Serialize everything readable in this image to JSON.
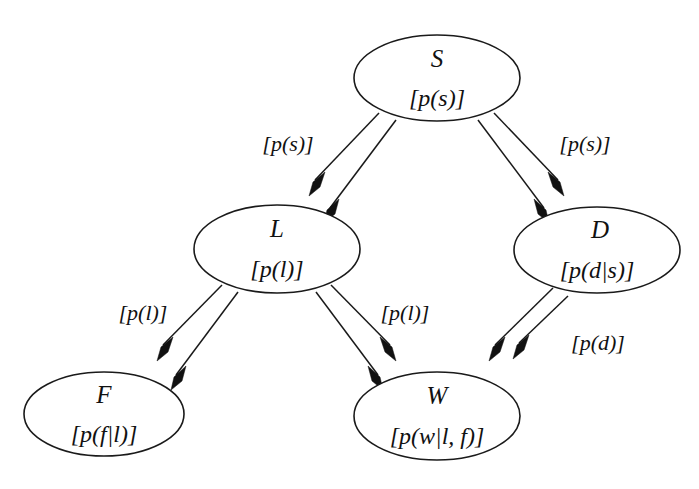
{
  "diagram": {
    "type": "bayesian-network-dag",
    "title": "",
    "background_color": "#ffffff",
    "stroke_color": "#1a1a1a",
    "nodes": [
      {
        "id": "S",
        "name": "S",
        "prob": "[p(s)]",
        "cx": 437,
        "cy": 78,
        "rx": 83,
        "ry": 43
      },
      {
        "id": "L",
        "name": "L",
        "prob": "[p(l)]",
        "cx": 277,
        "cy": 249,
        "rx": 83,
        "ry": 44
      },
      {
        "id": "D",
        "name": "D",
        "prob": "[p(d|s)]",
        "cx": 597,
        "cy": 250,
        "rx": 83,
        "ry": 43
      },
      {
        "id": "F",
        "name": "F",
        "prob": "[p(f|l)]",
        "cx": 104,
        "cy": 414,
        "rx": 80,
        "ry": 42
      },
      {
        "id": "W",
        "name": "W",
        "prob": "[p(w|l, f)]",
        "cx": 437,
        "cy": 416,
        "rx": 83,
        "ry": 44
      }
    ],
    "edges": [
      {
        "id": "S-L",
        "from": "S",
        "to": "L",
        "label": "[p(s)]",
        "label_x": 288,
        "label_y": 151
      },
      {
        "id": "S-D",
        "from": "S",
        "to": "D",
        "label": "[p(s)]",
        "label_x": 585,
        "label_y": 151
      },
      {
        "id": "L-F",
        "from": "L",
        "to": "F",
        "label": "[p(l)]",
        "label_x": 143,
        "label_y": 320
      },
      {
        "id": "L-W",
        "from": "L",
        "to": "W",
        "label": "[p(l)]",
        "label_x": 405,
        "label_y": 320
      },
      {
        "id": "D-W",
        "from": "D",
        "to": "W",
        "label": "[p(d)]",
        "label_x": 598,
        "label_y": 350
      }
    ]
  }
}
